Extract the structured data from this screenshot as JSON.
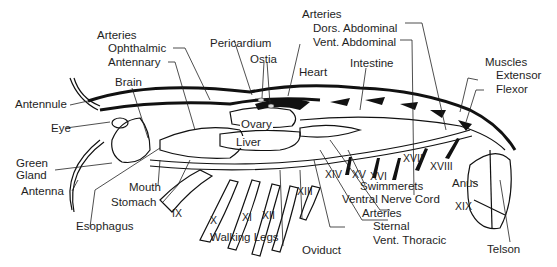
{
  "labels": {
    "arteries_head": "Arteries",
    "ophthalmic": "Ophthalmic",
    "antennary": "Antennary",
    "brain": "Brain",
    "antennule": "Antennule",
    "eye": "Eye",
    "green_gland_1": "Green",
    "green_gland_2": "Gland",
    "antenna": "Antenna",
    "mouth": "Mouth",
    "stomach": "Stomach",
    "esophagus": "Esophagus",
    "pericardium": "Pericardium",
    "ostia": "Ostia",
    "heart": "Heart",
    "ovary": "Ovary",
    "liver": "Liver",
    "arteries_abd": "Arteries",
    "dors_abdominal": "Dors. Abdominal",
    "vent_abdominal": "Vent. Abdominal",
    "intestine": "Intestine",
    "muscles": "Muscles",
    "extensor": "Extensor",
    "flexor": "Flexor",
    "walking_legs": "Walking Legs",
    "oviduct": "Oviduct",
    "swimmerets": "Swimmerets",
    "ventral_nerve_cord": "Ventral Nerve Cord",
    "arteries_vent": "Arteries",
    "sternal": "Sternal",
    "vent_thoracic": "Vent. Thoracic",
    "anus": "Anus",
    "telson": "Telson"
  },
  "segments": {
    "ix": "IX",
    "x": "X",
    "xi": "XI",
    "xii": "XII",
    "xiii": "XIII",
    "xiv": "XIV",
    "xv": "XV",
    "xvi": "XVI",
    "xvii": "XVII",
    "xviii": "XVIII",
    "xix": "XIX"
  }
}
